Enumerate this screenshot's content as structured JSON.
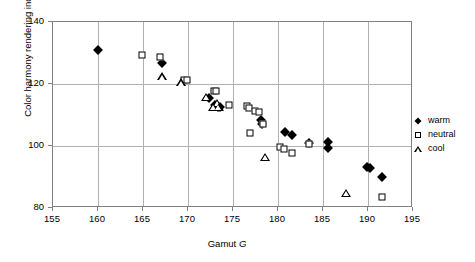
{
  "chart_data": {
    "type": "scatter",
    "title": "",
    "xlabel": "Gamut G",
    "xlabel_plain": "Gamut",
    "xlabel_symbol": "G",
    "ylabel": "Color harmony rendering index Rhr",
    "ylabel_plain": "Color harmony rendering index",
    "ylabel_symbol": "R",
    "ylabel_subscript": "hr",
    "xlim": [
      155,
      195
    ],
    "ylim": [
      80,
      140
    ],
    "xticks": [
      155,
      160,
      165,
      170,
      175,
      180,
      185,
      190,
      195
    ],
    "yticks": [
      80,
      100,
      120,
      140
    ],
    "grid": true,
    "legend_position": "right",
    "series": [
      {
        "name": "warm",
        "marker": "filled-diamond",
        "color": "#000000",
        "points": [
          [
            160.0,
            131.0
          ],
          [
            167.1,
            126.8
          ],
          [
            172.3,
            115.4
          ],
          [
            173.0,
            113.1
          ],
          [
            173.3,
            112.6
          ],
          [
            173.6,
            112.5
          ],
          [
            178.1,
            108.5
          ],
          [
            178.2,
            107.2
          ],
          [
            180.8,
            104.6
          ],
          [
            181.6,
            103.7
          ],
          [
            183.4,
            101.0
          ],
          [
            185.6,
            101.2
          ],
          [
            185.6,
            99.2
          ],
          [
            189.9,
            93.1
          ],
          [
            190.2,
            92.9
          ],
          [
            191.6,
            90.0
          ]
        ]
      },
      {
        "name": "neutral",
        "marker": "open-square",
        "color": "#000000",
        "points": [
          [
            164.9,
            129.2
          ],
          [
            166.9,
            128.8
          ],
          [
            169.6,
            121.4
          ],
          [
            169.9,
            121.3
          ],
          [
            172.9,
            117.8
          ],
          [
            173.1,
            117.6
          ],
          [
            174.6,
            113.2
          ],
          [
            176.5,
            112.9
          ],
          [
            176.8,
            112.4
          ],
          [
            177.4,
            111.4
          ],
          [
            177.9,
            111.0
          ],
          [
            178.3,
            107.0
          ],
          [
            176.9,
            104.1
          ],
          [
            180.2,
            99.8
          ],
          [
            180.7,
            99.1
          ],
          [
            181.6,
            97.9
          ],
          [
            183.4,
            100.8
          ],
          [
            191.6,
            83.6
          ]
        ]
      },
      {
        "name": "cool",
        "marker": "open-triangle",
        "color": "#000000",
        "points": [
          [
            167.1,
            122.6
          ],
          [
            169.2,
            120.6
          ],
          [
            172.0,
            115.9
          ],
          [
            173.2,
            114.0
          ],
          [
            172.8,
            112.7
          ],
          [
            173.4,
            112.7
          ],
          [
            178.6,
            96.6
          ],
          [
            187.6,
            85.0
          ]
        ]
      }
    ]
  },
  "legend": {
    "items": [
      {
        "label": "warm",
        "marker": "filled-diamond"
      },
      {
        "label": "neutral",
        "marker": "open-square"
      },
      {
        "label": "cool",
        "marker": "open-triangle"
      }
    ]
  }
}
